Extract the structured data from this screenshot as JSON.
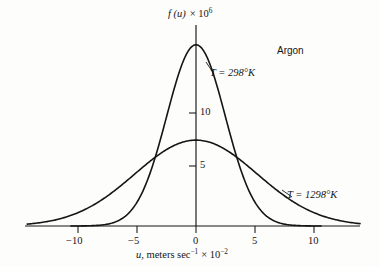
{
  "figure": {
    "background_color": "#fdfdfc",
    "ink_color": "#151515",
    "width": 379,
    "height": 267
  },
  "annotations": {
    "gas_label": "Argon",
    "series_label_cold": "T = 298°K",
    "series_label_hot": "T = 1298°K"
  },
  "axes": {
    "y_title_main": "f (u)",
    "y_title_times": "× 10",
    "y_title_exponent": "6",
    "x_title_var": "u",
    "x_title_rest": ", meters sec",
    "x_title_exp1": "−1",
    "x_title_times": "× 10",
    "x_title_exp2": "−2",
    "x_tick_labels": [
      "−10",
      "−5",
      "0",
      "5",
      "10"
    ],
    "y_tick_labels": [
      "5",
      "10"
    ]
  },
  "chart_data": {
    "type": "line",
    "title": "",
    "subtitle": "",
    "xlabel": "u, meters sec^-1 × 10^-2",
    "ylabel": "f(u) × 10^6",
    "annotation_gas": "Argon",
    "grid": false,
    "legend_position": "inline-annotations",
    "xlim": [
      -14.3,
      13.9
    ],
    "ylim": [
      0,
      19.0
    ],
    "xticks": [
      -10,
      -5,
      0,
      5,
      10
    ],
    "yticks": [
      5,
      10
    ],
    "x_units": "meters sec^-1 x 10^-2",
    "y_units": "f(u) x 10^6",
    "axis_geometry": {
      "origin_px": [
        196,
        226
      ],
      "px_per_x_unit": 11.8,
      "px_per_y_unit": 10.6,
      "x_axis_left_px": 25,
      "x_axis_right_px": 360,
      "y_axis_top_px": 25
    },
    "series": [
      {
        "name": "T = 298°K",
        "temperature_K": 298,
        "peak_value": 17.1,
        "peak_x": 0,
        "sigma_x_units": 2.48,
        "model": "gaussian",
        "x": [
          -10,
          -9,
          -8,
          -7,
          -6,
          -5,
          -4,
          -3,
          -2,
          -1,
          0,
          1,
          2,
          3,
          4,
          5,
          6,
          7,
          8,
          9,
          10
        ],
        "values": [
          0.03,
          0.12,
          0.4,
          1.16,
          2.86,
          5.99,
          10.66,
          16.13,
          20.77,
          22.75,
          17.1,
          22.75,
          20.77,
          16.13,
          10.66,
          5.99,
          2.86,
          1.16,
          0.4,
          0.12,
          0.03
        ]
      },
      {
        "name": "T = 1298°K",
        "temperature_K": 1298,
        "peak_value": 8.1,
        "peak_x": 0,
        "sigma_x_units": 5.18,
        "model": "gaussian",
        "x": [
          -14,
          -12,
          -10,
          -8,
          -6,
          -4,
          -2,
          0,
          2,
          4,
          6,
          8,
          10,
          12,
          14
        ],
        "values": [
          0.2,
          0.57,
          1.4,
          2.96,
          5.36,
          8.3,
          10.95,
          8.1,
          10.95,
          8.3,
          5.36,
          2.96,
          1.4,
          0.57,
          0.2
        ]
      }
    ]
  }
}
